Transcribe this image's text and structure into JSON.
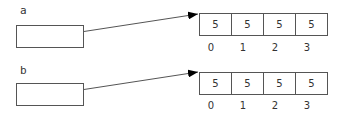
{
  "variables": [
    {
      "name": "a",
      "values": [
        "5",
        "5",
        "5",
        "5"
      ],
      "indices": [
        "0",
        "1",
        "2",
        "3"
      ]
    },
    {
      "name": "b",
      "values": [
        "5",
        "5",
        "5",
        "5"
      ],
      "indices": [
        "0",
        "1",
        "2",
        "3"
      ]
    }
  ],
  "colors": {
    "line": "#555555",
    "arrow": "#000000"
  }
}
